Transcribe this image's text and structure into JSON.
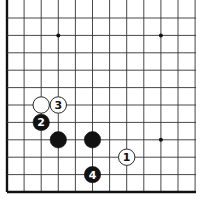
{
  "diagram": {
    "type": "go-board-corner",
    "grid": {
      "columns": 12,
      "rows": 11,
      "origin_x": 7,
      "origin_y": 18,
      "spacing_x": 17.1,
      "spacing_y": 17.4,
      "right_end": 196,
      "left_edge_thick": true,
      "bottom_edge_thick": true,
      "line_color": "#333333",
      "edge_color": "#111111"
    },
    "star_points": [
      {
        "col": 3,
        "row": 1
      },
      {
        "col": 9,
        "row": 1
      },
      {
        "col": 9,
        "row": 7
      }
    ],
    "stones": [
      {
        "color": "white",
        "col": 2,
        "row": 5,
        "label": ""
      },
      {
        "color": "white",
        "col": 3,
        "row": 5,
        "label": "3"
      },
      {
        "color": "black",
        "col": 2,
        "row": 6,
        "label": "2"
      },
      {
        "color": "black",
        "col": 3,
        "row": 7,
        "label": ""
      },
      {
        "color": "black",
        "col": 5,
        "row": 7,
        "label": ""
      },
      {
        "color": "white",
        "col": 7,
        "row": 8,
        "label": "1"
      },
      {
        "color": "black",
        "col": 5,
        "row": 9,
        "label": "4"
      }
    ]
  }
}
